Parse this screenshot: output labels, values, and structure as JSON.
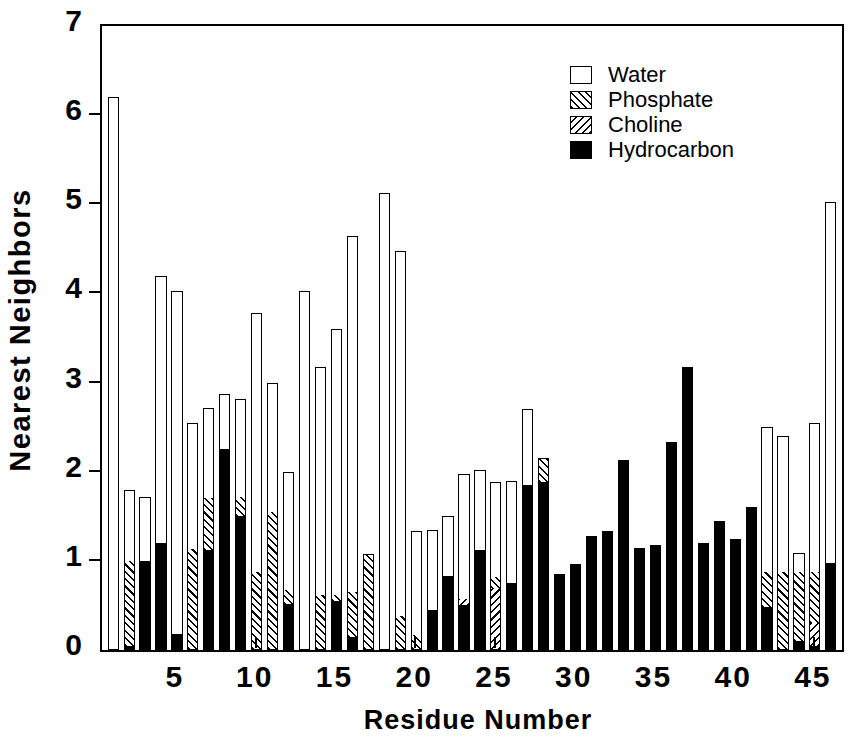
{
  "chart_data": {
    "type": "bar",
    "stacked": true,
    "title": "",
    "xlabel": "Residue  Number",
    "ylabel": "Nearest  Neighbors",
    "ylim": [
      0,
      7
    ],
    "yticks": [
      0,
      1,
      2,
      3,
      4,
      5,
      6,
      7
    ],
    "ytick_labels": [
      "0",
      "1",
      "2",
      "3",
      "4",
      "5",
      "6",
      "7"
    ],
    "xlim": [
      0.3,
      46.7
    ],
    "xticks": [
      5,
      10,
      15,
      20,
      25,
      30,
      35,
      40,
      45
    ],
    "xtick_labels": [
      "5",
      "10",
      "15",
      "20",
      "25",
      "30",
      "35",
      "40",
      "45"
    ],
    "grid": false,
    "legend_position": "top-right",
    "legend": [
      "Water",
      "Phosphate",
      "Choline",
      "Hydrocarbon"
    ],
    "series_colors": {
      "Water": "#ffffff",
      "Phosphate": "#ffffff",
      "Choline": "#ffffff",
      "Hydrocarbon": "#000000"
    },
    "series_patterns": {
      "Water": "empty",
      "Phosphate": "hatch-up",
      "Choline": "hatch-down",
      "Hydrocarbon": "solid"
    },
    "categories": [
      1,
      2,
      3,
      4,
      5,
      6,
      7,
      8,
      9,
      10,
      11,
      12,
      13,
      14,
      15,
      16,
      17,
      18,
      19,
      20,
      21,
      22,
      23,
      24,
      25,
      26,
      27,
      28,
      29,
      30,
      31,
      32,
      33,
      34,
      35,
      36,
      37,
      38,
      39,
      40,
      41,
      42,
      43,
      44,
      45,
      46
    ],
    "series": [
      {
        "name": "Hydrocarbon",
        "values": [
          0.0,
          0.05,
          1.0,
          1.2,
          0.18,
          0.0,
          1.12,
          2.25,
          1.5,
          0.0,
          0.0,
          0.52,
          0.0,
          0.0,
          0.55,
          0.15,
          0.0,
          0.0,
          0.0,
          0.0,
          0.45,
          0.83,
          0.5,
          1.12,
          0.0,
          0.75,
          1.85,
          1.88,
          0.85,
          0.96,
          1.28,
          1.33,
          2.13,
          1.15,
          1.18,
          2.33,
          3.17,
          1.2,
          1.45,
          1.25,
          1.6,
          0.48,
          0.0,
          0.1,
          0.05,
          0.98
        ]
      },
      {
        "name": "Choline",
        "values": [
          0.0,
          0.0,
          0.0,
          0.0,
          0.0,
          0.0,
          0.0,
          0.0,
          0.0,
          0.0,
          0.0,
          0.0,
          0.0,
          0.0,
          0.0,
          0.0,
          0.0,
          0.0,
          0.0,
          0.0,
          0.0,
          0.0,
          0.07,
          0.0,
          0.7,
          0.0,
          0.0,
          0.0,
          0.0,
          0.0,
          0.0,
          0.0,
          0.0,
          0.0,
          0.0,
          0.0,
          0.0,
          0.0,
          0.0,
          0.0,
          0.0,
          0.0,
          0.0,
          0.0,
          0.25,
          0.0
        ]
      },
      {
        "name": "Phosphate",
        "values": [
          0.0,
          0.95,
          0.0,
          0.0,
          0.0,
          1.13,
          0.58,
          0.0,
          0.22,
          0.88,
          1.55,
          0.15,
          0.0,
          0.62,
          0.07,
          0.5,
          1.08,
          0.0,
          0.38,
          0.17,
          0.0,
          0.0,
          0.0,
          0.0,
          0.12,
          0.0,
          0.0,
          0.27,
          0.0,
          0.0,
          0.0,
          0.0,
          0.0,
          0.0,
          0.0,
          0.0,
          0.0,
          0.0,
          0.0,
          0.0,
          0.0,
          0.4,
          0.88,
          0.77,
          0.58,
          0.0
        ]
      },
      {
        "name": "Water",
        "values": [
          6.2,
          0.8,
          0.72,
          3.0,
          3.85,
          1.42,
          1.02,
          0.62,
          1.1,
          2.9,
          1.45,
          1.33,
          4.03,
          2.56,
          2.98,
          4.0,
          0.0,
          5.13,
          4.1,
          1.17,
          0.9,
          0.67,
          1.4,
          0.9,
          1.07,
          1.15,
          0.85,
          0.0,
          0.0,
          0.0,
          0.0,
          0.0,
          0.0,
          0.0,
          0.0,
          0.0,
          0.0,
          0.0,
          0.0,
          0.0,
          0.0,
          1.62,
          1.52,
          0.22,
          1.67,
          4.05
        ]
      }
    ],
    "totals": [
      6.2,
      1.8,
      1.72,
      4.2,
      4.03,
      2.55,
      2.88,
      2.25,
      2.6,
      3.78,
      3.0,
      2.0,
      4.03,
      3.18,
      3.6,
      3.2,
      4.65,
      5.13,
      5.13,
      2.88,
      4.48,
      1.33,
      1.5,
      1.97,
      2.03,
      1.9,
      1.85,
      2.7,
      2.15,
      1.88,
      0.85,
      0.96,
      1.28,
      1.33,
      2.13,
      2.33,
      3.17,
      1.2,
      1.45,
      1.25,
      1.6,
      2.5,
      2.4,
      1.1,
      2.53,
      5.03
    ]
  },
  "legend": {
    "items": [
      {
        "label": "Water",
        "swatch": "empty"
      },
      {
        "label": "Phosphate",
        "swatch": "hatch-up"
      },
      {
        "label": "Choline",
        "swatch": "hatch-down"
      },
      {
        "label": "Hydrocarbon",
        "swatch": "solid"
      }
    ]
  }
}
